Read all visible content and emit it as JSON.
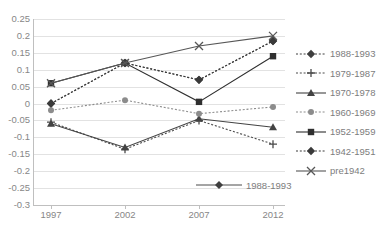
{
  "chart_data": {
    "type": "line",
    "title": "",
    "title_clipped": true,
    "xlabel": "",
    "ylabel": "",
    "categories": [
      "1997",
      "2002",
      "2007",
      "2012"
    ],
    "x": [
      1997,
      2002,
      2007,
      2012
    ],
    "ylim": [
      -0.3,
      0.25
    ],
    "yticks": [
      "0.25",
      "0.2",
      "0.15",
      "0.1",
      "0.05",
      "0",
      "-0.05",
      "-0.1",
      "-0.15",
      "-0.2",
      "-0.25",
      "-0.3"
    ],
    "ytick_values": [
      0.25,
      0.2,
      0.15,
      0.1,
      0.05,
      0,
      -0.05,
      -0.1,
      -0.15,
      -0.2,
      -0.25,
      -0.3
    ],
    "grid": true,
    "legend_position": "right",
    "series": [
      {
        "name": "1988-1993",
        "marker": "diamond",
        "line_style": "dotted",
        "color": "#3f3f3f",
        "values": [
          0.0,
          0.12,
          0.07,
          0.185
        ]
      },
      {
        "name": "1979-1987",
        "marker": "plus",
        "line_style": "dotted",
        "color": "#4a4a4a",
        "values": [
          -0.055,
          -0.135,
          -0.05,
          -0.12
        ]
      },
      {
        "name": "1970-1978",
        "marker": "triangle",
        "line_style": "solid",
        "color": "#434343",
        "values": [
          -0.06,
          -0.13,
          -0.045,
          -0.07
        ]
      },
      {
        "name": "1960-1969",
        "marker": "circle",
        "line_style": "dotted",
        "color": "#8c8c8c",
        "values": [
          -0.02,
          0.01,
          -0.03,
          -0.01
        ]
      },
      {
        "name": "1952-1959",
        "marker": "square",
        "line_style": "solid",
        "color": "#2f2f2f",
        "values": [
          0.06,
          0.12,
          0.005,
          0.14
        ]
      },
      {
        "name": "1942-1951",
        "marker": "diamond",
        "line_style": "dotted",
        "color": "#3a3a3a",
        "values": [
          0.0,
          0.12,
          0.07,
          0.185
        ]
      },
      {
        "name": "pre1942",
        "marker": "cross",
        "line_style": "solid",
        "color": "#575757",
        "values": [
          0.06,
          0.12,
          0.17,
          0.2
        ]
      }
    ],
    "overflow_legend_item": {
      "label": "1988-1993",
      "marker": "diamond",
      "line_style": "solid",
      "y_value": -0.25
    }
  },
  "legend": {
    "items": [
      {
        "label": "1988-1993"
      },
      {
        "label": "1979-1987"
      },
      {
        "label": "1970-1978"
      },
      {
        "label": "1960-1969"
      },
      {
        "label": "1952-1959"
      },
      {
        "label": "1942-1951"
      },
      {
        "label": "pre1942"
      }
    ]
  }
}
